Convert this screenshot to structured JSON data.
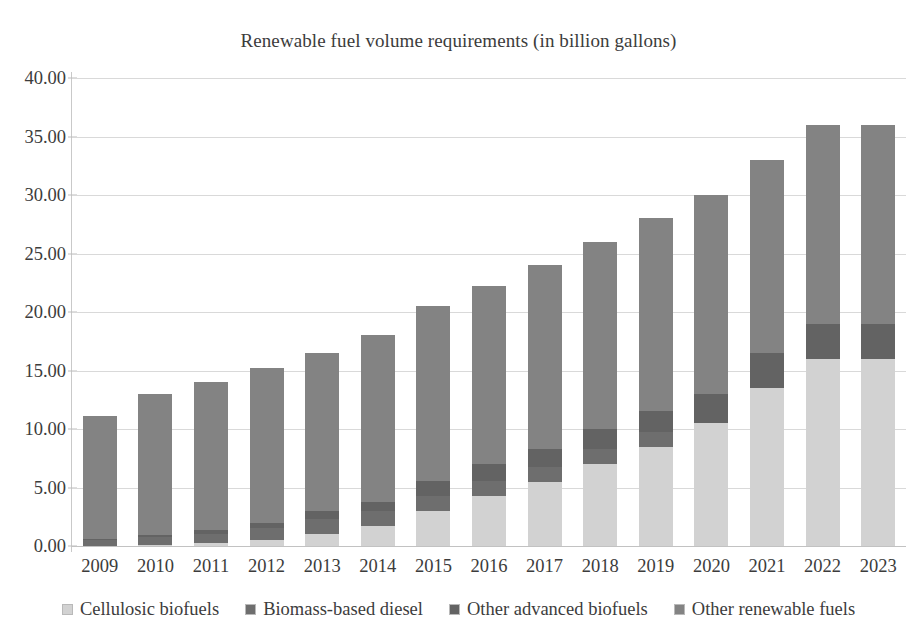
{
  "chart_data": {
    "type": "bar",
    "stacked": true,
    "title": "Renewable fuel volume requirements (in billion gallons)",
    "xlabel": "",
    "ylabel": "",
    "ylim": [
      0,
      40
    ],
    "ytick_step": 5,
    "ytick_labels": [
      "40.00",
      "35.00",
      "30.00",
      "25.00",
      "20.00",
      "15.00",
      "10.00",
      "5.00",
      "0.00"
    ],
    "ytick_values": [
      40,
      35,
      30,
      25,
      20,
      15,
      10,
      5,
      0
    ],
    "grid": true,
    "legend_position": "bottom",
    "categories": [
      "2009",
      "2010",
      "2011",
      "2012",
      "2013",
      "2014",
      "2015",
      "2016",
      "2017",
      "2018",
      "2019",
      "2020",
      "2021",
      "2022",
      "2023"
    ],
    "series": [
      {
        "name": "Cellulosic biofuels",
        "color": "#d2d2d2",
        "values": [
          0.0,
          0.1,
          0.25,
          0.5,
          1.0,
          1.75,
          3.0,
          4.25,
          5.5,
          7.0,
          8.5,
          10.5,
          13.5,
          16.0,
          16.0
        ]
      },
      {
        "name": "Biomass-based diesel",
        "color": "#6e6e6e",
        "values": [
          0.5,
          0.65,
          0.8,
          1.0,
          1.28,
          1.28,
          1.28,
          1.28,
          1.28,
          1.28,
          1.28,
          0.0,
          0.0,
          0.0,
          0.0
        ]
      },
      {
        "name": "Other advanced biofuels",
        "color": "#636363",
        "values": [
          0.1,
          0.2,
          0.3,
          0.5,
          0.75,
          0.75,
          1.25,
          1.5,
          1.5,
          1.75,
          1.75,
          2.5,
          3.0,
          3.0,
          3.0
        ]
      },
      {
        "name": "Other renewable fuels",
        "color": "#838383",
        "values": [
          10.5,
          12.05,
          12.65,
          13.2,
          13.47,
          14.22,
          14.97,
          15.17,
          15.72,
          15.97,
          16.47,
          17.0,
          16.5,
          17.0,
          17.0
        ]
      }
    ],
    "totals": [
      11.1,
      13.0,
      14.0,
      15.2,
      16.5,
      18.0,
      20.5,
      22.2,
      24.0,
      26.0,
      28.0,
      30.0,
      33.0,
      36.0,
      36.0
    ]
  },
  "legend": {
    "items": [
      {
        "label": "Cellulosic biofuels",
        "color": "#d2d2d2"
      },
      {
        "label": "Biomass-based diesel",
        "color": "#6e6e6e"
      },
      {
        "label": "Other advanced biofuels",
        "color": "#636363"
      },
      {
        "label": "Other renewable fuels",
        "color": "#838383"
      }
    ]
  }
}
